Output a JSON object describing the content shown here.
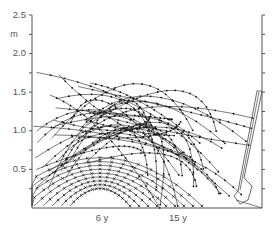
{
  "chart_data": {
    "type": "line",
    "title": "",
    "xlabel": "",
    "ylabel": "m",
    "ylim": [
      0,
      2.5
    ],
    "yticks": [
      {
        "value": 2.5,
        "label": "2.5"
      },
      {
        "value": 2.0,
        "label": "2.0"
      },
      {
        "value": 1.5,
        "label": "1.5"
      },
      {
        "value": 1.0,
        "label": "1.0"
      },
      {
        "value": 0.5,
        "label": "0.5"
      }
    ],
    "xtick_labels": [
      {
        "label": "6 y",
        "x_frac": 0.3
      },
      {
        "label": "15 y",
        "x_frac": 0.63
      }
    ],
    "minor_tick_step": 0.25,
    "grid": false,
    "legend": "none",
    "series": [
      {
        "name": "6 y arcs",
        "marker": "x",
        "count": 9,
        "base_height_m": 0.35,
        "height_step_m": 0.1
      },
      {
        "name": "15 y arcs",
        "marker": "dot",
        "count": 34,
        "height_range_m": [
          0.6,
          2.1
        ]
      }
    ],
    "annotation_shape": {
      "name": "right-edge outline",
      "top_height_m": 1.5,
      "bottom_height_m": 0.0
    }
  },
  "axis": {
    "y_unit": "m",
    "labels": [
      "2.5",
      "2.0",
      "1.5",
      "1.0",
      "0.5"
    ],
    "x_labels": [
      "6 y",
      "15 y"
    ]
  }
}
